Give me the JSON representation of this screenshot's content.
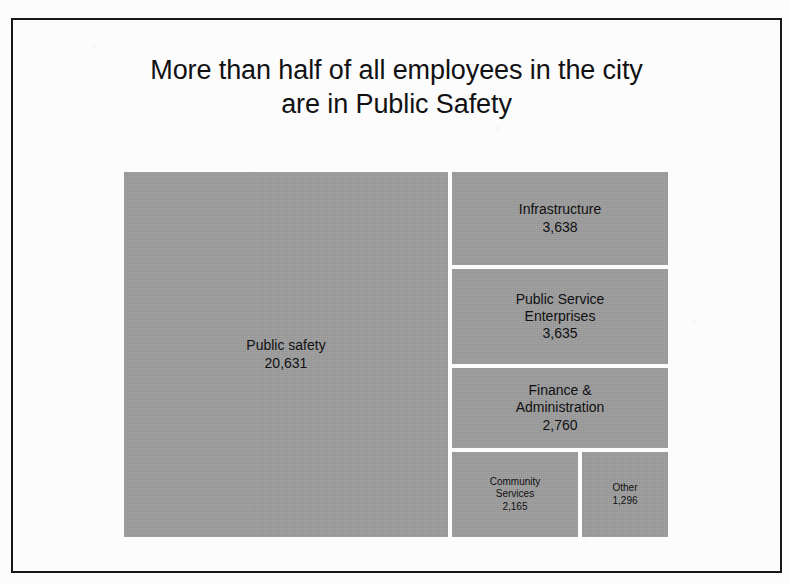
{
  "slide": {
    "title_line_1": "More than half of all employees in the city",
    "title_line_2": "are in Public Safety",
    "frame_color": "#17171a",
    "background_color": "#fcfcfc",
    "tile_color": "#9d9d9d",
    "text_color": "#101012"
  },
  "chart_data": {
    "type": "treemap",
    "title": "More than half of all employees in the city are in Public Safety",
    "xlabel": "",
    "ylabel": "",
    "legend": "none",
    "grid": false,
    "value_unit": "employees",
    "total": 34125,
    "categories": [
      "Public safety",
      "Infrastructure",
      "Public Service Enterprises",
      "Finance & Administration",
      "Community Services",
      "Other"
    ],
    "values": [
      20631,
      3638,
      3635,
      2760,
      2165,
      1296
    ],
    "tiles": [
      {
        "id": "public-safety",
        "label": "Public safety",
        "value": 20631,
        "value_text": "20,631"
      },
      {
        "id": "infrastructure",
        "label": "Infrastructure",
        "value": 3638,
        "value_text": "3,638"
      },
      {
        "id": "public-service-enterprises",
        "label_line_1": "Public Service",
        "label_line_2": "Enterprises",
        "label": "Public Service Enterprises",
        "value": 3635,
        "value_text": "3,635"
      },
      {
        "id": "finance-administration",
        "label_line_1": "Finance &",
        "label_line_2": "Administration",
        "label": "Finance & Administration",
        "value": 2760,
        "value_text": "2,760"
      },
      {
        "id": "community-services",
        "label_line_1": "Community",
        "label_line_2": "Services",
        "label": "Community Services",
        "value": 2165,
        "value_text": "2,165"
      },
      {
        "id": "other",
        "label": "Other",
        "value": 1296,
        "value_text": "1,296"
      }
    ]
  }
}
